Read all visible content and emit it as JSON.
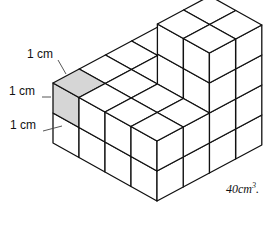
{
  "figure": {
    "labels": [
      {
        "text": "1 cm",
        "x": 27,
        "y": 54
      },
      {
        "text": "1 cm",
        "x": 9,
        "y": 90
      },
      {
        "text": "1 cm",
        "x": 10,
        "y": 124
      }
    ],
    "volume": {
      "value": "40cm",
      "exponent": "3",
      "suffix": "."
    },
    "colors": {
      "stroke": "#111111",
      "shaded": "#d6d6d6",
      "face": "#ffffff"
    },
    "heights": [
      [
        2,
        2,
        2,
        2
      ],
      [
        2,
        2,
        2,
        2
      ],
      [
        2,
        2,
        4,
        4
      ],
      [
        2,
        2,
        4,
        4
      ]
    ],
    "shaded_cube": {
      "r": 0,
      "b": 0,
      "u": 1
    }
  }
}
